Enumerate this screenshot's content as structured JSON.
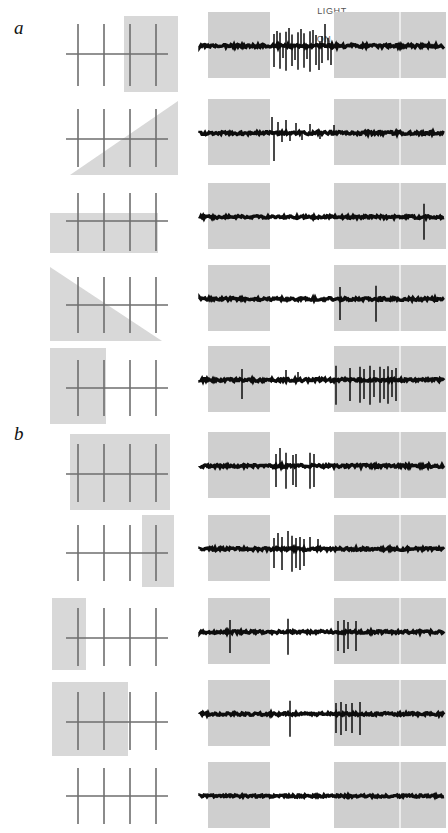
{
  "figure": {
    "type": "electrophysiology-recording-figure",
    "width": 448,
    "height": 833,
    "background_color": "#ffffff"
  },
  "panels": [
    {
      "label": "a",
      "x": 14,
      "y": 18
    },
    {
      "label": "b",
      "x": 14,
      "y": 424
    }
  ],
  "header": {
    "light_label": "LIGHT",
    "light_x": 312,
    "light_y": 6,
    "on_label": "ON",
    "on_x": 304,
    "on_y": 34,
    "off_left_label": "OFF",
    "off_left_x": 240,
    "off_left_y": 34,
    "off_right_label": "OFF",
    "off_right_x": 370,
    "off_right_y": 34
  },
  "colors": {
    "gray_patch": "#d8d8d8",
    "gray_patch_light": "#dcdcdc",
    "bar_stroke": "#6e6e6e",
    "trace_ink": "#0d0d0d",
    "band_gray": "#cfcfcf",
    "text_gray": "#666666",
    "label_black": "#111111"
  },
  "stimulus": {
    "description": "four vertical bars crossed by one horizontal bar, with a gray masking patch",
    "bar_count": 4,
    "bar_stroke_width": 1.6,
    "horizontal_bar_stroke_width": 1.6,
    "patch_shapes": [
      "square",
      "triangle",
      "rectangle",
      "none"
    ]
  },
  "trace": {
    "description": "extracellular spike train with stimulus-period shading",
    "left_off_band": {
      "x": 10,
      "width": 62
    },
    "on_band": {
      "x": 72,
      "width": 64
    },
    "right_off_band": {
      "x": 136,
      "width": 112
    },
    "tick_line_x": 202,
    "baseline_y": 36,
    "total_width": 248,
    "total_height": 72
  },
  "rows": [
    {
      "id": "a1",
      "panel": "a",
      "y": 10,
      "height": 88,
      "stim": {
        "x": 62,
        "width": 120,
        "height": 88,
        "patch": {
          "type": "rect",
          "x": 62,
          "y": 6,
          "w": 54,
          "h": 76
        },
        "bars_x": [
          16,
          42,
          68,
          94
        ],
        "bar_top": 14,
        "bar_bottom": 76,
        "h_bar_y": 44,
        "h_bar_x1": 4,
        "h_bar_x2": 106
      },
      "trace": {
        "x": 198,
        "noise_amp": 3.2,
        "spikes": [
          {
            "x": 76,
            "h": 22,
            "dir": "both"
          },
          {
            "x": 79,
            "h": 15,
            "dir": "up"
          },
          {
            "x": 82,
            "h": 24,
            "dir": "both"
          },
          {
            "x": 85,
            "h": 12,
            "dir": "down"
          },
          {
            "x": 88,
            "h": 26,
            "dir": "both"
          },
          {
            "x": 91,
            "h": 18,
            "dir": "up"
          },
          {
            "x": 94,
            "h": 21,
            "dir": "both"
          },
          {
            "x": 97,
            "h": 14,
            "dir": "down"
          },
          {
            "x": 100,
            "h": 25,
            "dir": "both"
          },
          {
            "x": 103,
            "h": 17,
            "dir": "up"
          },
          {
            "x": 106,
            "h": 23,
            "dir": "both"
          },
          {
            "x": 109,
            "h": 13,
            "dir": "down"
          },
          {
            "x": 112,
            "h": 27,
            "dir": "both"
          },
          {
            "x": 115,
            "h": 16,
            "dir": "up"
          },
          {
            "x": 118,
            "h": 20,
            "dir": "both"
          },
          {
            "x": 121,
            "h": 24,
            "dir": "down"
          },
          {
            "x": 124,
            "h": 18,
            "dir": "both"
          },
          {
            "x": 127,
            "h": 22,
            "dir": "up"
          },
          {
            "x": 130,
            "h": 15,
            "dir": "both"
          },
          {
            "x": 133,
            "h": 19,
            "dir": "down"
          }
        ]
      }
    },
    {
      "id": "a2",
      "panel": "a",
      "y": 97,
      "height": 84,
      "stim": {
        "x": 62,
        "width": 120,
        "height": 84,
        "patch": {
          "type": "triangle-lower-right",
          "x": 8,
          "y": 4,
          "w": 108,
          "h": 74
        },
        "bars_x": [
          16,
          42,
          68,
          94
        ],
        "bar_top": 12,
        "bar_bottom": 70,
        "h_bar_y": 42,
        "h_bar_x1": 4,
        "h_bar_x2": 106
      },
      "trace": {
        "x": 198,
        "noise_amp": 3.0,
        "spikes": [
          {
            "x": 74,
            "h": 16,
            "dir": "up"
          },
          {
            "x": 76,
            "h": 28,
            "dir": "down"
          },
          {
            "x": 80,
            "h": 11,
            "dir": "up"
          },
          {
            "x": 84,
            "h": 9,
            "dir": "down"
          },
          {
            "x": 88,
            "h": 13,
            "dir": "up"
          },
          {
            "x": 92,
            "h": 8,
            "dir": "down"
          },
          {
            "x": 98,
            "h": 10,
            "dir": "up"
          },
          {
            "x": 104,
            "h": 7,
            "dir": "down"
          },
          {
            "x": 112,
            "h": 9,
            "dir": "up"
          },
          {
            "x": 122,
            "h": 6,
            "dir": "down"
          },
          {
            "x": 136,
            "h": 8,
            "dir": "up"
          }
        ]
      }
    },
    {
      "id": "a3",
      "panel": "a",
      "y": 181,
      "height": 82,
      "stim": {
        "x": 46,
        "width": 136,
        "height": 82,
        "patch": {
          "type": "rect",
          "x": 4,
          "y": 32,
          "w": 108,
          "h": 40
        },
        "bars_x": [
          32,
          58,
          84,
          110
        ],
        "bar_top": 12,
        "bar_bottom": 70,
        "h_bar_y": 40,
        "h_bar_x1": 20,
        "h_bar_x2": 122
      },
      "trace": {
        "x": 198,
        "noise_amp": 2.6,
        "spikes": [
          {
            "x": 226,
            "h": 24,
            "dir": "both"
          }
        ]
      }
    },
    {
      "id": "a4",
      "panel": "a",
      "y": 263,
      "height": 84,
      "stim": {
        "x": 46,
        "width": 136,
        "height": 84,
        "patch": {
          "type": "triangle-upper-left",
          "x": 4,
          "y": 4,
          "w": 112,
          "h": 74
        },
        "bars_x": [
          32,
          58,
          84,
          110
        ],
        "bar_top": 14,
        "bar_bottom": 70,
        "h_bar_y": 42,
        "h_bar_x1": 20,
        "h_bar_x2": 122
      },
      "trace": {
        "x": 198,
        "noise_amp": 2.8,
        "spikes": [
          {
            "x": 142,
            "h": 22,
            "dir": "both"
          },
          {
            "x": 178,
            "h": 24,
            "dir": "both"
          }
        ]
      }
    },
    {
      "id": "a5",
      "panel": "a",
      "y": 344,
      "height": 86,
      "stim": {
        "x": 46,
        "width": 136,
        "height": 86,
        "patch": {
          "type": "rect",
          "x": 4,
          "y": 4,
          "w": 56,
          "h": 76
        },
        "bars_x": [
          32,
          58,
          84,
          110
        ],
        "bar_top": 16,
        "bar_bottom": 72,
        "h_bar_y": 44,
        "h_bar_x1": 20,
        "h_bar_x2": 122
      },
      "trace": {
        "x": 198,
        "noise_amp": 3.0,
        "spikes": [
          {
            "x": 44,
            "h": 20,
            "dir": "both"
          },
          {
            "x": 88,
            "h": 10,
            "dir": "up"
          },
          {
            "x": 100,
            "h": 8,
            "dir": "up"
          },
          {
            "x": 138,
            "h": 26,
            "dir": "both"
          },
          {
            "x": 152,
            "h": 22,
            "dir": "both"
          },
          {
            "x": 162,
            "h": 24,
            "dir": "both"
          },
          {
            "x": 166,
            "h": 20,
            "dir": "both"
          },
          {
            "x": 172,
            "h": 26,
            "dir": "both"
          },
          {
            "x": 176,
            "h": 18,
            "dir": "both"
          },
          {
            "x": 182,
            "h": 24,
            "dir": "both"
          },
          {
            "x": 186,
            "h": 20,
            "dir": "both"
          },
          {
            "x": 190,
            "h": 25,
            "dir": "both"
          },
          {
            "x": 194,
            "h": 18,
            "dir": "both"
          },
          {
            "x": 198,
            "h": 22,
            "dir": "both"
          }
        ]
      }
    },
    {
      "id": "b1",
      "panel": "b",
      "y": 430,
      "height": 84,
      "stim": {
        "x": 62,
        "width": 120,
        "height": 84,
        "patch": {
          "type": "rect",
          "x": 8,
          "y": 4,
          "w": 100,
          "h": 76
        },
        "bars_x": [
          16,
          42,
          68,
          94
        ],
        "bar_top": 14,
        "bar_bottom": 72,
        "h_bar_y": 44,
        "h_bar_x1": 4,
        "h_bar_x2": 106
      },
      "trace": {
        "x": 198,
        "noise_amp": 2.8,
        "spikes": [
          {
            "x": 78,
            "h": 22,
            "dir": "both"
          },
          {
            "x": 82,
            "h": 18,
            "dir": "up"
          },
          {
            "x": 88,
            "h": 24,
            "dir": "both"
          },
          {
            "x": 95,
            "h": 20,
            "dir": "both"
          },
          {
            "x": 98,
            "h": 22,
            "dir": "both"
          },
          {
            "x": 112,
            "h": 24,
            "dir": "both"
          },
          {
            "x": 116,
            "h": 22,
            "dir": "both"
          }
        ]
      }
    },
    {
      "id": "b2",
      "panel": "b",
      "y": 513,
      "height": 82,
      "stim": {
        "x": 62,
        "width": 120,
        "height": 82,
        "patch": {
          "type": "rect",
          "x": 80,
          "y": 2,
          "w": 32,
          "h": 72
        },
        "bars_x": [
          16,
          42,
          68,
          94
        ],
        "bar_top": 12,
        "bar_bottom": 68,
        "h_bar_y": 40,
        "h_bar_x1": 4,
        "h_bar_x2": 106
      },
      "trace": {
        "x": 198,
        "noise_amp": 2.8,
        "spikes": [
          {
            "x": 76,
            "h": 20,
            "dir": "both"
          },
          {
            "x": 80,
            "h": 16,
            "dir": "up"
          },
          {
            "x": 84,
            "h": 22,
            "dir": "both"
          },
          {
            "x": 90,
            "h": 18,
            "dir": "up"
          },
          {
            "x": 94,
            "h": 24,
            "dir": "both"
          },
          {
            "x": 98,
            "h": 20,
            "dir": "both"
          },
          {
            "x": 102,
            "h": 22,
            "dir": "both"
          },
          {
            "x": 106,
            "h": 18,
            "dir": "both"
          },
          {
            "x": 112,
            "h": 12,
            "dir": "up"
          },
          {
            "x": 120,
            "h": 10,
            "dir": "up"
          }
        ]
      }
    },
    {
      "id": "b3",
      "panel": "b",
      "y": 596,
      "height": 82,
      "stim": {
        "x": 46,
        "width": 136,
        "height": 82,
        "patch": {
          "type": "rect",
          "x": 6,
          "y": 2,
          "w": 34,
          "h": 72
        },
        "bars_x": [
          32,
          58,
          84,
          110
        ],
        "bar_top": 12,
        "bar_bottom": 70,
        "h_bar_y": 42,
        "h_bar_x1": 20,
        "h_bar_x2": 122
      },
      "trace": {
        "x": 198,
        "noise_amp": 2.6,
        "spikes": [
          {
            "x": 32,
            "h": 22,
            "dir": "both"
          },
          {
            "x": 90,
            "h": 24,
            "dir": "both"
          },
          {
            "x": 140,
            "h": 20,
            "dir": "both"
          },
          {
            "x": 146,
            "h": 22,
            "dir": "both"
          },
          {
            "x": 150,
            "h": 18,
            "dir": "both"
          },
          {
            "x": 158,
            "h": 20,
            "dir": "both"
          }
        ]
      }
    },
    {
      "id": "b4",
      "panel": "b",
      "y": 678,
      "height": 84,
      "stim": {
        "x": 46,
        "width": 136,
        "height": 84,
        "patch": {
          "type": "rect",
          "x": 6,
          "y": 4,
          "w": 76,
          "h": 74
        },
        "bars_x": [
          32,
          58,
          84,
          110
        ],
        "bar_top": 14,
        "bar_bottom": 72,
        "h_bar_y": 44,
        "h_bar_x1": 20,
        "h_bar_x2": 122
      },
      "trace": {
        "x": 198,
        "noise_amp": 2.6,
        "spikes": [
          {
            "x": 92,
            "h": 24,
            "dir": "both"
          },
          {
            "x": 138,
            "h": 20,
            "dir": "both"
          },
          {
            "x": 143,
            "h": 22,
            "dir": "both"
          },
          {
            "x": 148,
            "h": 18,
            "dir": "both"
          },
          {
            "x": 154,
            "h": 20,
            "dir": "both"
          },
          {
            "x": 162,
            "h": 22,
            "dir": "both"
          }
        ]
      }
    },
    {
      "id": "b5",
      "panel": "b",
      "y": 760,
      "height": 74,
      "stim": {
        "x": 62,
        "width": 120,
        "height": 74,
        "patch": {
          "type": "none"
        },
        "bars_x": [
          16,
          42,
          68,
          94
        ],
        "bar_top": 8,
        "bar_bottom": 64,
        "h_bar_y": 36,
        "h_bar_x1": 4,
        "h_bar_x2": 106
      },
      "trace": {
        "x": 198,
        "noise_amp": 2.2,
        "spikes": []
      }
    }
  ],
  "chart_data": {
    "type": "line",
    "xlabel": "time (light OFF / ON / OFF)",
    "ylabel": "extracellular potential",
    "legend": [
      "LIGHT",
      "ON",
      "OFF"
    ],
    "series": [
      {
        "name": "a1",
        "spike_count": 20,
        "burst_location": "ON"
      },
      {
        "name": "a2",
        "spike_count": 11,
        "burst_location": "ON-onset"
      },
      {
        "name": "a3",
        "spike_count": 1,
        "burst_location": "late-OFF"
      },
      {
        "name": "a4",
        "spike_count": 2,
        "burst_location": "OFF-right"
      },
      {
        "name": "a5",
        "spike_count": 14,
        "burst_location": "OFF-right"
      },
      {
        "name": "b1",
        "spike_count": 7,
        "burst_location": "ON"
      },
      {
        "name": "b2",
        "spike_count": 10,
        "burst_location": "ON"
      },
      {
        "name": "b3",
        "spike_count": 6,
        "burst_location": "OFF-right-onset"
      },
      {
        "name": "b4",
        "spike_count": 6,
        "burst_location": "OFF-right-onset"
      },
      {
        "name": "b5",
        "spike_count": 0,
        "burst_location": "none"
      }
    ]
  }
}
